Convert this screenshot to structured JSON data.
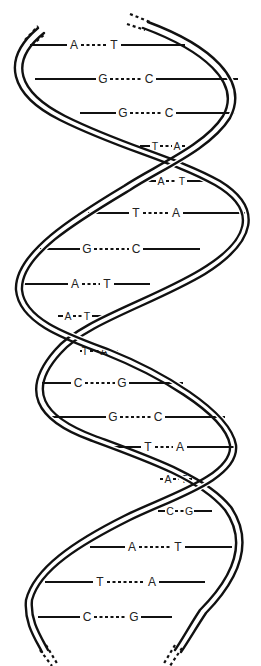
{
  "figure": {
    "colors": {
      "ink": "#111111",
      "background": "#ffffff"
    }
  },
  "base_pairs": [
    {
      "left": "A",
      "right": "T",
      "y": 45,
      "x1": 30,
      "x2": 185,
      "lx": 74,
      "rx": 114,
      "small": false
    },
    {
      "left": "G",
      "right": "C",
      "y": 79,
      "x1": 35,
      "x2": 238,
      "lx": 103,
      "rx": 149,
      "small": false
    },
    {
      "left": "G",
      "right": "C",
      "y": 113,
      "x1": 80,
      "x2": 235,
      "lx": 123,
      "rx": 169,
      "small": false
    },
    {
      "left": "T",
      "right": "A",
      "y": 146,
      "x1": 140,
      "x2": 185,
      "lx": 155,
      "rx": 177,
      "small": true
    },
    {
      "left": "A",
      "right": "T",
      "y": 181,
      "x1": 145,
      "x2": 205,
      "lx": 161,
      "rx": 182,
      "small": true
    },
    {
      "left": "T",
      "right": "A",
      "y": 213,
      "x1": 88,
      "x2": 245,
      "lx": 136,
      "rx": 176,
      "small": false
    },
    {
      "left": "G",
      "right": "C",
      "y": 249,
      "x1": 40,
      "x2": 200,
      "lx": 87,
      "rx": 136,
      "small": false
    },
    {
      "left": "A",
      "right": "T",
      "y": 284,
      "x1": 22,
      "x2": 150,
      "lx": 75,
      "rx": 107,
      "small": false
    },
    {
      "left": "A",
      "right": "T",
      "y": 316,
      "x1": 58,
      "x2": 105,
      "lx": 68,
      "rx": 87,
      "small": true
    },
    {
      "left": "T",
      "right": "A",
      "y": 351,
      "x1": 82,
      "x2": 118,
      "lx": 85,
      "rx": 104,
      "small": true
    },
    {
      "left": "C",
      "right": "G",
      "y": 383,
      "x1": 42,
      "x2": 183,
      "lx": 78,
      "rx": 122,
      "small": false
    },
    {
      "left": "G",
      "right": "C",
      "y": 417,
      "x1": 48,
      "x2": 225,
      "lx": 113,
      "rx": 158,
      "small": false
    },
    {
      "left": "T",
      "right": "A",
      "y": 447,
      "x1": 105,
      "x2": 235,
      "lx": 148,
      "rx": 180,
      "small": false
    },
    {
      "left": "A",
      "right": "T",
      "y": 479,
      "x1": 160,
      "x2": 192,
      "lx": 168,
      "rx": 184,
      "small": true
    },
    {
      "left": "C",
      "right": "G",
      "y": 511,
      "x1": 158,
      "x2": 212,
      "lx": 170,
      "rx": 189,
      "small": true
    },
    {
      "left": "A",
      "right": "T",
      "y": 547,
      "x1": 90,
      "x2": 232,
      "lx": 132,
      "rx": 178,
      "small": false
    },
    {
      "left": "T",
      "right": "A",
      "y": 582,
      "x1": 45,
      "x2": 205,
      "lx": 100,
      "rx": 152,
      "small": false
    },
    {
      "left": "C",
      "right": "G",
      "y": 617,
      "x1": 38,
      "x2": 172,
      "lx": 87,
      "rx": 134,
      "small": false
    }
  ]
}
